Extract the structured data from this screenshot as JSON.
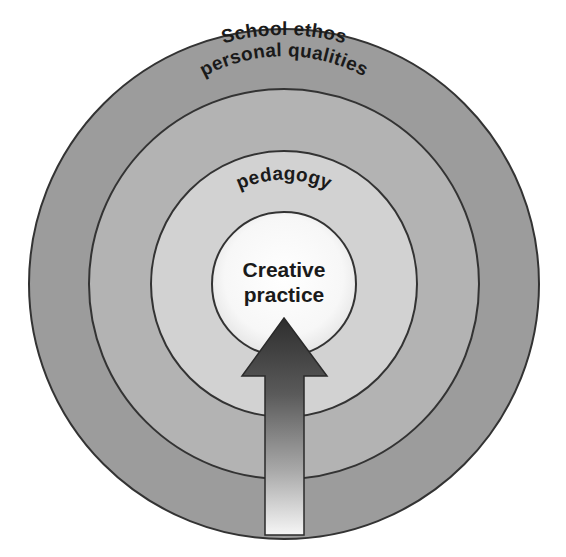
{
  "diagram": {
    "type": "concentric-circles",
    "rings": [
      {
        "id": "outer",
        "label": "School ethos",
        "fill": "#9c9c9c",
        "radius": 255
      },
      {
        "id": "second",
        "label": "personal qualities",
        "fill": "#b3b3b3",
        "radius": 195
      },
      {
        "id": "third",
        "label": "pedagogy",
        "fill": "#d2d2d2",
        "radius": 133
      },
      {
        "id": "core",
        "label_line1": "Creative",
        "label_line2": "practice",
        "fill": "#ffffff",
        "radius": 72
      }
    ],
    "arrow": {
      "direction": "up",
      "description": "Gradient arrow pointing from the outer edge into the core",
      "gradient_top": "#3a3a3a",
      "gradient_bottom": "#f4f4f4"
    },
    "stroke_color": "#333333"
  }
}
